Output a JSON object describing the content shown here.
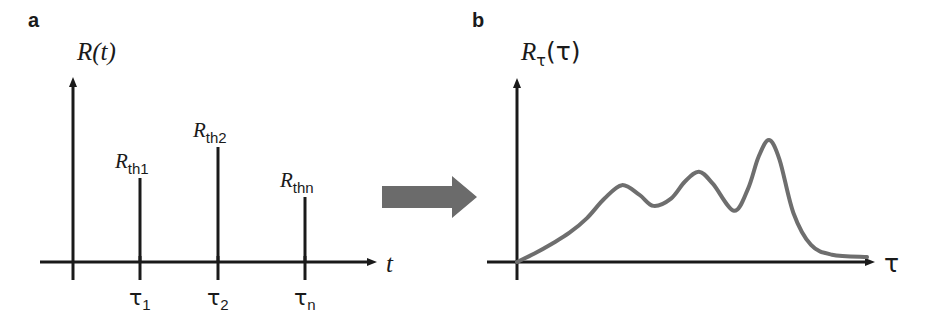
{
  "figure": {
    "background_color": "#ffffff",
    "ink_color": "#1a1a1a",
    "curve_color": "#6e6e6e",
    "arrow_color": "#6b6b6b"
  },
  "panel_a": {
    "label": "a",
    "y_axis_label": "R",
    "y_axis_label_arg": "(t)",
    "x_axis_label": "t",
    "impulses": [
      {
        "label_base": "R",
        "label_sub": "th1",
        "tick_label_base": "τ",
        "tick_label_sub": "1"
      },
      {
        "label_base": "R",
        "label_sub": "th2",
        "tick_label_base": "τ",
        "tick_label_sub": "2"
      },
      {
        "label_base": "R",
        "label_sub": "thn",
        "tick_label_base": "τ",
        "tick_label_sub": "n"
      }
    ]
  },
  "panel_b": {
    "label": "b",
    "y_axis_label": "R",
    "y_axis_label_sub": "τ",
    "y_axis_label_arg": "(τ)",
    "x_axis_label": "τ"
  },
  "transform_arrow": {
    "name": "rightward-block-arrow",
    "direction": "right"
  },
  "chart_data": [
    {
      "type": "bar",
      "title": "R(t) discrete thermal resistance impulses",
      "xlabel": "t",
      "ylabel": "R(t)",
      "categories": [
        "τ₁",
        "τ₂",
        "τₙ"
      ],
      "series": [
        {
          "name": "R_th",
          "values": [
            0.66,
            0.82,
            0.5
          ]
        }
      ],
      "value_labels": [
        "R_th1",
        "R_th2",
        "R_thn"
      ],
      "grid": false,
      "legend": "none",
      "xlim": [
        0,
        1
      ],
      "ylim": [
        0,
        1
      ],
      "pixel_geometry": {
        "y_axis_x": 73,
        "x_axis_y": 262,
        "x_axis_end": 375,
        "y_axis_top": 80,
        "impulse_x": [
          140,
          218,
          305
        ],
        "impulse_top_y": [
          178,
          147,
          197
        ]
      }
    },
    {
      "type": "line",
      "title": "R_τ(τ) continuous time-constant spectrum",
      "xlabel": "τ",
      "ylabel": "R_τ(τ)",
      "grid": false,
      "legend": "none",
      "xlim": [
        0,
        1
      ],
      "ylim": [
        0,
        1
      ],
      "peaks": [
        {
          "x": 0.3,
          "y": 0.63
        },
        {
          "x": 0.52,
          "y": 0.74
        },
        {
          "x": 0.72,
          "y": 1.0
        }
      ],
      "valleys": [
        {
          "x": 0.39,
          "y": 0.46
        },
        {
          "x": 0.62,
          "y": 0.42
        }
      ],
      "x": [
        0.0,
        0.05,
        0.1,
        0.15,
        0.2,
        0.25,
        0.3,
        0.35,
        0.39,
        0.44,
        0.48,
        0.52,
        0.56,
        0.62,
        0.66,
        0.69,
        0.72,
        0.75,
        0.79,
        0.84,
        0.9,
        1.0
      ],
      "y": [
        0.0,
        0.07,
        0.15,
        0.24,
        0.36,
        0.52,
        0.63,
        0.55,
        0.46,
        0.52,
        0.66,
        0.74,
        0.64,
        0.42,
        0.6,
        0.86,
        1.0,
        0.84,
        0.4,
        0.14,
        0.06,
        0.04
      ],
      "pixel_geometry": {
        "y_axis_x": 517,
        "x_axis_y": 262,
        "x_axis_end": 873,
        "y_axis_top": 81,
        "curve_stroke_width": 4
      }
    }
  ]
}
